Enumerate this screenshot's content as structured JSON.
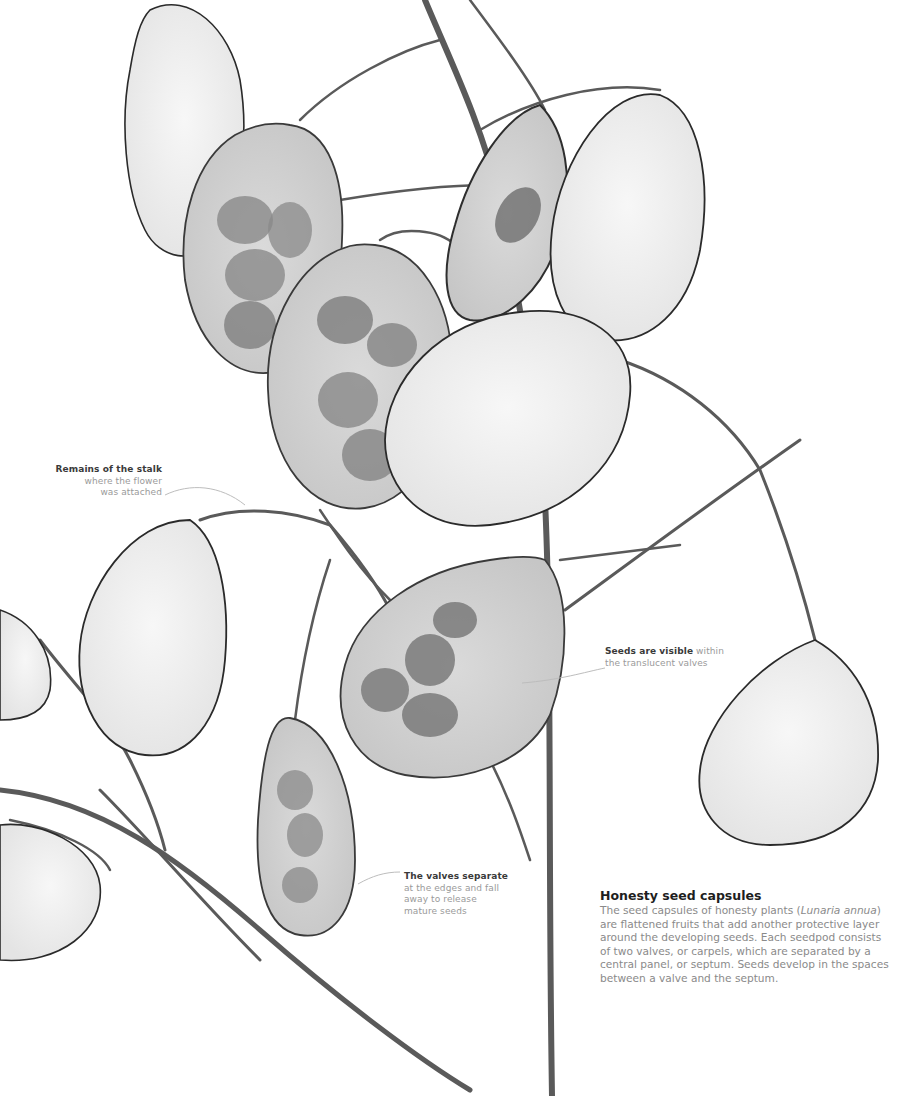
{
  "figure": {
    "colors": {
      "background": "#ffffff",
      "stem": "#555555",
      "pod_fill": "#d8d8d8",
      "seed": "#777777",
      "annotation_heading": "#3a3a3a",
      "annotation_text": "#9a9a9a"
    }
  },
  "annotations": [
    {
      "heading": "Remains of the stalk",
      "lines": [
        "where the flower",
        "was attached"
      ]
    },
    {
      "heading": "Seeds are visible",
      "lines": [
        "within",
        "the translucent valves"
      ]
    },
    {
      "heading": "The valves separate",
      "lines": [
        "at the edges and fall",
        "away to release",
        "mature seeds"
      ]
    }
  ],
  "caption": {
    "title": "Honesty seed capsules",
    "body_pre": "The seed capsules of honesty plants (",
    "body_italic": "Lunaria annua",
    "body_post": ") are flattened fruits that add another protective layer around the developing seeds. Each seedpod consists of two valves, or carpels, which are separated by a central panel, or septum. Seeds develop in the spaces between a valve and the septum."
  }
}
